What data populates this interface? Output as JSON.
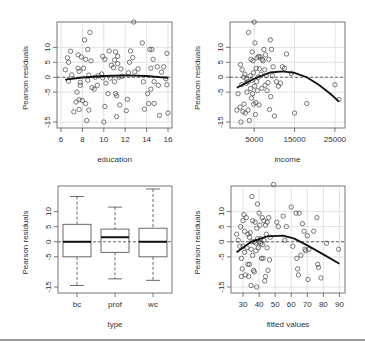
{
  "figure": {
    "ylabel": "Pearson residuals",
    "bottom_rule_color": "#9a9a9a"
  },
  "chart_data": [
    {
      "type": "scatter",
      "panel": "top-left",
      "xlabel": "education",
      "ylabel": "Pearson residuals",
      "xlim": [
        6,
        16
      ],
      "ylim": [
        -16,
        17.5
      ],
      "xticks": [
        6,
        8,
        10,
        12,
        14,
        16
      ],
      "yticks": [
        -15,
        -5,
        0,
        5,
        10
      ],
      "grid": true,
      "hline": 0,
      "points": [
        [
          6.4,
          2.5
        ],
        [
          6.6,
          6.5
        ],
        [
          6.7,
          5
        ],
        [
          6.7,
          -1.3
        ],
        [
          6.9,
          8.7
        ],
        [
          7.0,
          0.8
        ],
        [
          7.2,
          -11.6
        ],
        [
          7.4,
          -8.3
        ],
        [
          7.5,
          -5
        ],
        [
          7.6,
          7.5
        ],
        [
          7.6,
          3
        ],
        [
          7.7,
          -10.8
        ],
        [
          7.7,
          -7.5
        ],
        [
          7.7,
          2
        ],
        [
          7.8,
          -1.7
        ],
        [
          7.8,
          -2.7
        ],
        [
          7.9,
          6.8
        ],
        [
          8.0,
          -7.8
        ],
        [
          8.1,
          3
        ],
        [
          8.2,
          12.5
        ],
        [
          8.3,
          6
        ],
        [
          8.3,
          -8.8
        ],
        [
          8.4,
          -14.5
        ],
        [
          8.5,
          9.3
        ],
        [
          8.5,
          -1
        ],
        [
          8.6,
          0.7
        ],
        [
          8.6,
          -11
        ],
        [
          8.7,
          15
        ],
        [
          8.8,
          5.5
        ],
        [
          8.9,
          -3.5
        ],
        [
          9.1,
          -4
        ],
        [
          9.2,
          0
        ],
        [
          9.4,
          -2.7
        ],
        [
          9.5,
          0.5
        ],
        [
          9.8,
          1.1
        ],
        [
          9.9,
          7
        ],
        [
          9.9,
          -0.2
        ],
        [
          10.0,
          -15
        ],
        [
          10.1,
          6
        ],
        [
          10.1,
          -9.8
        ],
        [
          10.2,
          -2
        ],
        [
          10.4,
          -5.5
        ],
        [
          10.5,
          8.8
        ],
        [
          10.6,
          -0.3
        ],
        [
          10.7,
          4
        ],
        [
          10.9,
          3.2
        ],
        [
          11.0,
          5.8
        ],
        [
          11.0,
          -1.5
        ],
        [
          11.1,
          8.5
        ],
        [
          11.1,
          -5.5
        ],
        [
          11.2,
          -6.2
        ],
        [
          11.2,
          -13.2
        ],
        [
          11.3,
          7
        ],
        [
          11.3,
          4.5
        ],
        [
          11.4,
          0
        ],
        [
          11.5,
          -9.3
        ],
        [
          11.6,
          2.8
        ],
        [
          11.7,
          0.3
        ],
        [
          12.1,
          -11.2
        ],
        [
          12.2,
          -7.4
        ],
        [
          12.3,
          1.5
        ],
        [
          12.4,
          5
        ],
        [
          12.5,
          8.8
        ],
        [
          12.7,
          6.6
        ],
        [
          12.8,
          18.5
        ],
        [
          12.9,
          1.8
        ],
        [
          13.2,
          2.8
        ],
        [
          13.6,
          11.5
        ],
        [
          13.7,
          -1.5
        ],
        [
          13.8,
          -10.7
        ],
        [
          14.1,
          -5.5
        ],
        [
          14.2,
          -8.8
        ],
        [
          14.3,
          9.3
        ],
        [
          14.4,
          -4
        ],
        [
          14.4,
          3
        ],
        [
          14.5,
          9.3
        ],
        [
          14.6,
          6
        ],
        [
          14.7,
          -8.8
        ],
        [
          14.7,
          -1.5
        ],
        [
          15.0,
          3.5
        ],
        [
          15.1,
          -2.7
        ],
        [
          15.2,
          -12.8
        ],
        [
          15.4,
          1.7
        ],
        [
          15.6,
          3.5
        ],
        [
          15.8,
          -0.5
        ],
        [
          15.9,
          -2.5
        ],
        [
          15.9,
          8
        ],
        [
          16.0,
          -12
        ]
      ],
      "curve": [
        [
          6.4,
          -0.8
        ],
        [
          8,
          -0.1
        ],
        [
          10,
          0.4
        ],
        [
          12,
          0.6
        ],
        [
          14,
          0.4
        ],
        [
          16,
          -0.2
        ]
      ]
    },
    {
      "type": "scatter",
      "panel": "top-right",
      "xlabel": "income",
      "ylabel": "Pearson residuals",
      "xlim": [
        0,
        26500
      ],
      "ylim": [
        -16,
        17.5
      ],
      "xticks": [
        5000,
        15000,
        25000
      ],
      "yticks": [
        -15,
        -5,
        0,
        5,
        10
      ],
      "grid": true,
      "hline": 0,
      "points": [
        [
          700,
          -11
        ],
        [
          1000,
          -5.5
        ],
        [
          1500,
          -10
        ],
        [
          1600,
          4.2
        ],
        [
          1700,
          -15
        ],
        [
          1900,
          -2.5
        ],
        [
          2000,
          2.5
        ],
        [
          2200,
          -11.5
        ],
        [
          2400,
          0
        ],
        [
          2500,
          -9
        ],
        [
          2700,
          1
        ],
        [
          2800,
          -12
        ],
        [
          3000,
          -2
        ],
        [
          3100,
          -0.5
        ],
        [
          3200,
          -5
        ],
        [
          3400,
          -1.5
        ],
        [
          3500,
          -11
        ],
        [
          3600,
          15
        ],
        [
          3800,
          -14.5
        ],
        [
          4000,
          0.5
        ],
        [
          4100,
          -3.8
        ],
        [
          4200,
          6
        ],
        [
          4300,
          -7
        ],
        [
          4400,
          -1
        ],
        [
          4500,
          8.5
        ],
        [
          4600,
          -5.5
        ],
        [
          4700,
          5.5
        ],
        [
          4800,
          1.5
        ],
        [
          4900,
          -9
        ],
        [
          5000,
          18.5
        ],
        [
          5100,
          -3
        ],
        [
          5200,
          11.5
        ],
        [
          5300,
          -12.5
        ],
        [
          5400,
          -8.5
        ],
        [
          5500,
          3
        ],
        [
          5600,
          -1.5
        ],
        [
          5700,
          6.5
        ],
        [
          5800,
          -4.5
        ],
        [
          6000,
          0
        ],
        [
          6100,
          7
        ],
        [
          6200,
          -9.3
        ],
        [
          6300,
          2.8
        ],
        [
          6500,
          6.8
        ],
        [
          6700,
          1
        ],
        [
          6900,
          -3.7
        ],
        [
          7000,
          6
        ],
        [
          7200,
          5.5
        ],
        [
          7400,
          9.3
        ],
        [
          7600,
          2.5
        ],
        [
          7700,
          -2.7
        ],
        [
          7800,
          7.5
        ],
        [
          8000,
          0.5
        ],
        [
          8200,
          -4.5
        ],
        [
          8400,
          -1.8
        ],
        [
          8600,
          6
        ],
        [
          8800,
          -10.8
        ],
        [
          9000,
          12.5
        ],
        [
          9100,
          -6.5
        ],
        [
          9300,
          9.3
        ],
        [
          9500,
          0.5
        ],
        [
          9700,
          3.5
        ],
        [
          10000,
          -13
        ],
        [
          10500,
          -1.5
        ],
        [
          11000,
          -3
        ],
        [
          11500,
          -2
        ],
        [
          12000,
          3.5
        ],
        [
          12500,
          3
        ],
        [
          13000,
          7.8
        ],
        [
          14200,
          1.3
        ],
        [
          15000,
          -12
        ],
        [
          18000,
          -8.8
        ],
        [
          25000,
          -2.5
        ],
        [
          26000,
          -7.5
        ]
      ],
      "curve": [
        [
          700,
          -3.5
        ],
        [
          5000,
          -0.5
        ],
        [
          9000,
          1.6
        ],
        [
          12000,
          2
        ],
        [
          15000,
          1.5
        ],
        [
          18000,
          0
        ],
        [
          21000,
          -2.5
        ],
        [
          24000,
          -5.7
        ],
        [
          26000,
          -8.2
        ]
      ]
    },
    {
      "type": "box",
      "panel": "bottom-left",
      "xlabel": "type",
      "ylabel": "Pearson residuals",
      "categories": [
        "bc",
        "prof",
        "wc"
      ],
      "ylim": [
        -16,
        17.5
      ],
      "yticks": [
        -15,
        -5,
        0,
        5,
        10
      ],
      "hline": 0,
      "boxes": [
        {
          "name": "bc",
          "whisker_low": -14.5,
          "q1": -5,
          "median": 0,
          "q3": 5.8,
          "whisker_high": 15
        },
        {
          "name": "prof",
          "whisker_low": -12.3,
          "q1": -3.5,
          "median": 1.5,
          "q3": 4.2,
          "whisker_high": 11.5
        },
        {
          "name": "wc",
          "whisker_low": -12.8,
          "q1": -5,
          "median": 0,
          "q3": 4.5,
          "whisker_high": 17.5
        }
      ]
    },
    {
      "type": "scatter",
      "panel": "bottom-right",
      "xlabel": "fitted values",
      "ylabel": "Pearson residuals",
      "xlim": [
        25,
        91
      ],
      "ylim": [
        -16,
        17.5
      ],
      "xticks": [
        30,
        40,
        50,
        60,
        70,
        80,
        90
      ],
      "yticks": [
        -15,
        -5,
        0,
        5,
        10
      ],
      "grid": true,
      "hline": 0,
      "points": [
        [
          26,
          2.5
        ],
        [
          27,
          0.5
        ],
        [
          28,
          -1.5
        ],
        [
          28.5,
          5
        ],
        [
          29,
          -5.5
        ],
        [
          29,
          -11.5
        ],
        [
          29.5,
          -9
        ],
        [
          30,
          7
        ],
        [
          30,
          -1.5
        ],
        [
          30.5,
          9
        ],
        [
          31,
          -3.5
        ],
        [
          31,
          3.5
        ],
        [
          31.5,
          -11
        ],
        [
          32,
          8
        ],
        [
          32.5,
          -2
        ],
        [
          33,
          2.5
        ],
        [
          33,
          -7.5
        ],
        [
          33.5,
          -11.5
        ],
        [
          34,
          -7.5
        ],
        [
          34,
          1.5
        ],
        [
          34.5,
          3
        ],
        [
          35,
          -2.5
        ],
        [
          35,
          -14.5
        ],
        [
          35.5,
          15
        ],
        [
          35.5,
          0
        ],
        [
          36,
          7
        ],
        [
          36,
          -4.5
        ],
        [
          36.5,
          -9.5
        ],
        [
          37,
          0
        ],
        [
          37,
          -10
        ],
        [
          37.5,
          6.5
        ],
        [
          38,
          -0.5
        ],
        [
          38,
          -3
        ],
        [
          38.5,
          4.5
        ],
        [
          38.5,
          -15
        ],
        [
          39,
          12.5
        ],
        [
          39,
          1
        ],
        [
          39.5,
          -2
        ],
        [
          40,
          9.5
        ],
        [
          40,
          0
        ],
        [
          40.5,
          5.5
        ],
        [
          41,
          -0.5
        ],
        [
          41,
          1
        ],
        [
          41.5,
          -5.5
        ],
        [
          42,
          -1
        ],
        [
          42,
          8
        ],
        [
          42.5,
          -5.5
        ],
        [
          43,
          7
        ],
        [
          43,
          0.5
        ],
        [
          43.5,
          -13
        ],
        [
          44,
          5.5
        ],
        [
          44,
          -11.5
        ],
        [
          44.5,
          2.5
        ],
        [
          45,
          -2
        ],
        [
          45,
          6.5
        ],
        [
          45.5,
          -9.5
        ],
        [
          46,
          8
        ],
        [
          46.5,
          -6
        ],
        [
          47,
          1.5
        ],
        [
          49,
          19
        ],
        [
          51,
          6.5
        ],
        [
          52,
          5
        ],
        [
          55,
          8.5
        ],
        [
          56,
          0.5
        ],
        [
          57,
          5
        ],
        [
          60,
          11.5
        ],
        [
          61,
          -1.5
        ],
        [
          63,
          9.5
        ],
        [
          63.5,
          -5.5
        ],
        [
          64,
          -9
        ],
        [
          64.5,
          -11
        ],
        [
          65,
          9.5
        ],
        [
          66,
          -4.5
        ],
        [
          67,
          6
        ],
        [
          68,
          3.5
        ],
        [
          68.5,
          -2.5
        ],
        [
          69,
          -3
        ],
        [
          70,
          2
        ],
        [
          70.5,
          -12.5
        ],
        [
          71,
          -2.5
        ],
        [
          74,
          3.5
        ],
        [
          76,
          8
        ],
        [
          76.5,
          -7.5
        ],
        [
          77,
          -8.5
        ],
        [
          78.5,
          -12
        ],
        [
          82,
          -0.5
        ],
        [
          89.5,
          -2.5
        ]
      ],
      "curve": [
        [
          26,
          -3.5
        ],
        [
          35,
          0
        ],
        [
          45,
          1.8
        ],
        [
          55,
          2
        ],
        [
          62,
          1
        ],
        [
          70,
          -1.2
        ],
        [
          80,
          -4.2
        ],
        [
          90,
          -7.3
        ]
      ]
    }
  ]
}
